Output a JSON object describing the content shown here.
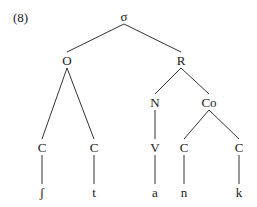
{
  "example_number": "(8)",
  "tree": {
    "nodes": [
      {
        "id": "sigma",
        "label": "σ",
        "x": 124,
        "y": 16
      },
      {
        "id": "onset",
        "label": "O",
        "x": 67,
        "y": 60
      },
      {
        "id": "rhyme",
        "label": "R",
        "x": 181,
        "y": 60
      },
      {
        "id": "nucleus",
        "label": "N",
        "x": 155,
        "y": 102
      },
      {
        "id": "coda",
        "label": "Co",
        "x": 209,
        "y": 102
      },
      {
        "id": "c1",
        "label": "C",
        "x": 42,
        "y": 147
      },
      {
        "id": "c2",
        "label": "C",
        "x": 94,
        "y": 147
      },
      {
        "id": "v",
        "label": "V",
        "x": 155,
        "y": 147
      },
      {
        "id": "c3",
        "label": "C",
        "x": 184,
        "y": 147
      },
      {
        "id": "c4",
        "label": "C",
        "x": 239,
        "y": 147
      },
      {
        "id": "seg1",
        "label": "ʃ",
        "x": 42,
        "y": 192
      },
      {
        "id": "seg2",
        "label": "t",
        "x": 94,
        "y": 192
      },
      {
        "id": "seg3",
        "label": "a",
        "x": 155,
        "y": 192
      },
      {
        "id": "seg4",
        "label": "n",
        "x": 184,
        "y": 192
      },
      {
        "id": "seg5",
        "label": "k",
        "x": 239,
        "y": 192
      }
    ],
    "edges": [
      [
        "sigma",
        "onset"
      ],
      [
        "sigma",
        "rhyme"
      ],
      [
        "onset",
        "c1"
      ],
      [
        "onset",
        "c2"
      ],
      [
        "rhyme",
        "nucleus"
      ],
      [
        "rhyme",
        "coda"
      ],
      [
        "nucleus",
        "v"
      ],
      [
        "coda",
        "c3"
      ],
      [
        "coda",
        "c4"
      ],
      [
        "c1",
        "seg1"
      ],
      [
        "c2",
        "seg2"
      ],
      [
        "v",
        "seg3"
      ],
      [
        "c3",
        "seg4"
      ],
      [
        "c4",
        "seg5"
      ]
    ]
  }
}
